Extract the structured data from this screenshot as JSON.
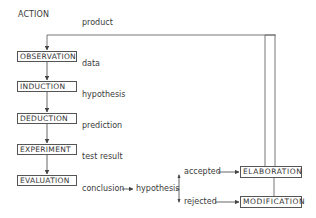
{
  "title": "ACTION",
  "feedback_label": "product",
  "steps": [
    {
      "label": "OBSERVATION",
      "output": "data"
    },
    {
      "label": "INDUCTION",
      "output": "hypothesis"
    },
    {
      "label": "DEDUCTION",
      "output": "prediction"
    },
    {
      "label": "EXPERIMENT",
      "output": "test result"
    },
    {
      "label": "EVALUATION",
      "output": "conclusion"
    }
  ],
  "decision": {
    "label": "hypothesis",
    "accepted_label": "accepted",
    "rejected_label": "rejected"
  },
  "outcomes": {
    "accepted": "ELABORATION",
    "rejected": "MODIFICATION"
  },
  "colors": {
    "line": "#555555",
    "text": "#3a3a3a",
    "background": "#ffffff"
  }
}
